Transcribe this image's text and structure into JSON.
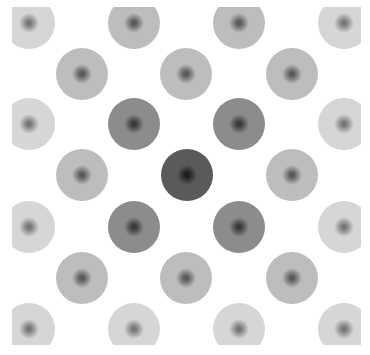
{
  "figure": {
    "spot_radius": 26,
    "spots": [
      {
        "x": 29,
        "y": 23,
        "level": 3
      },
      {
        "x": 134,
        "y": 23,
        "level": 2
      },
      {
        "x": 239,
        "y": 23,
        "level": 2
      },
      {
        "x": 344,
        "y": 23,
        "level": 3
      },
      {
        "x": 82,
        "y": 74,
        "level": 2
      },
      {
        "x": 186,
        "y": 74,
        "level": 2
      },
      {
        "x": 292,
        "y": 74,
        "level": 2
      },
      {
        "x": 29,
        "y": 124,
        "level": 3
      },
      {
        "x": 134,
        "y": 124,
        "level": 1
      },
      {
        "x": 239,
        "y": 124,
        "level": 1
      },
      {
        "x": 344,
        "y": 124,
        "level": 3
      },
      {
        "x": 82,
        "y": 175,
        "level": 2
      },
      {
        "x": 187,
        "y": 175,
        "level": 0
      },
      {
        "x": 292,
        "y": 175,
        "level": 2
      },
      {
        "x": 29,
        "y": 227,
        "level": 3
      },
      {
        "x": 134,
        "y": 227,
        "level": 1
      },
      {
        "x": 239,
        "y": 227,
        "level": 1
      },
      {
        "x": 344,
        "y": 227,
        "level": 3
      },
      {
        "x": 82,
        "y": 278,
        "level": 2
      },
      {
        "x": 186,
        "y": 278,
        "level": 2
      },
      {
        "x": 292,
        "y": 278,
        "level": 2
      },
      {
        "x": 29,
        "y": 329,
        "level": 3
      },
      {
        "x": 134,
        "y": 329,
        "level": 3
      },
      {
        "x": 239,
        "y": 329,
        "level": 3
      },
      {
        "x": 344,
        "y": 329,
        "level": 3
      }
    ],
    "levels": [
      {
        "edge": "#5a5a5a",
        "center": "#1e1e1e"
      },
      {
        "edge": "#8c8c8c",
        "center": "#3a3a3a"
      },
      {
        "edge": "#bdbdbd",
        "center": "#5a5a5a"
      },
      {
        "edge": "#d6d6d6",
        "center": "#777777"
      }
    ]
  }
}
